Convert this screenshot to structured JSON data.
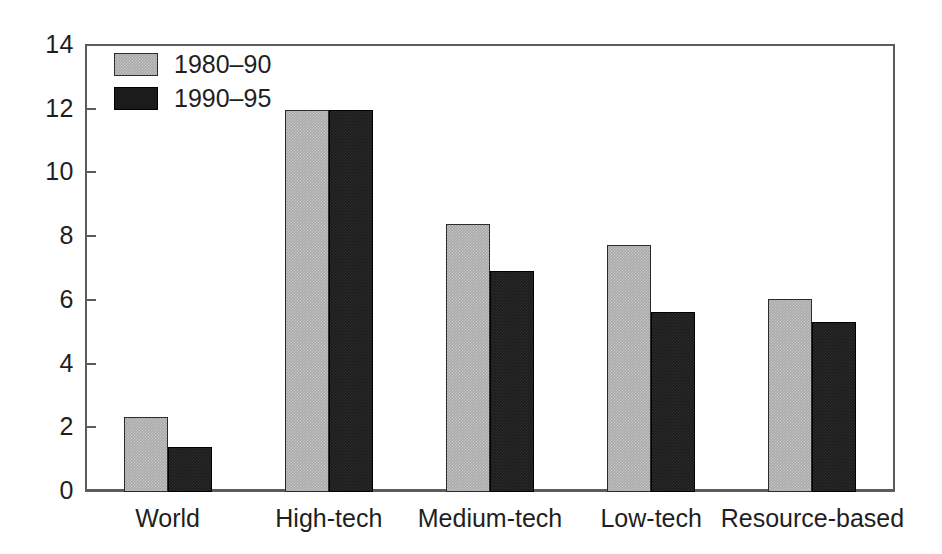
{
  "chart_data": {
    "type": "bar",
    "title": "",
    "subtitle": "",
    "xlabel": "",
    "ylabel": "",
    "categories": [
      "World",
      "High-tech",
      "Medium-tech",
      "Low-tech",
      "Resource-based"
    ],
    "series": [
      {
        "name": "1980–90",
        "color": "#a9a9a9",
        "values": [
          2.35,
          12.0,
          8.4,
          7.75,
          6.05
        ]
      },
      {
        "name": "1990–95",
        "color": "#1b1b1b",
        "values": [
          1.4,
          12.0,
          6.95,
          5.65,
          5.35
        ]
      }
    ],
    "ylim": [
      0,
      14
    ],
    "yticks": [
      0,
      2,
      4,
      6,
      8,
      10,
      12,
      14
    ],
    "ytick_labels": [
      "0",
      "2",
      "4",
      "6",
      "8",
      "10",
      "12",
      "14"
    ],
    "grid": false,
    "legend_position": "top-left",
    "axis_color": "#5c5c5c",
    "background": "#ffffff"
  },
  "legend": {
    "items": [
      {
        "label": "1980–90"
      },
      {
        "label": "1990–95"
      }
    ]
  }
}
